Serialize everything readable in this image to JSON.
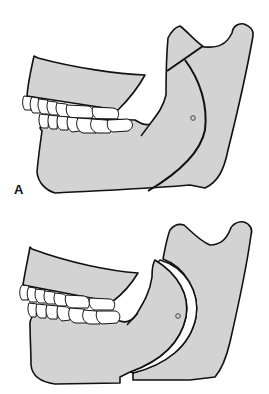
{
  "figure": {
    "type": "anatomical illustration",
    "panels": [
      {
        "id": "A",
        "label": "A",
        "description": "Mandible with oblique osteotomy line drawn through ramus"
      },
      {
        "id": "B",
        "label": "B",
        "description": "Mandible after osteotomy with proximal and distal segments separated"
      }
    ]
  },
  "colors": {
    "bone_fill": "#d3d3d3",
    "outline": "#111111",
    "teeth": "#ffffff",
    "background": "#ffffff"
  }
}
